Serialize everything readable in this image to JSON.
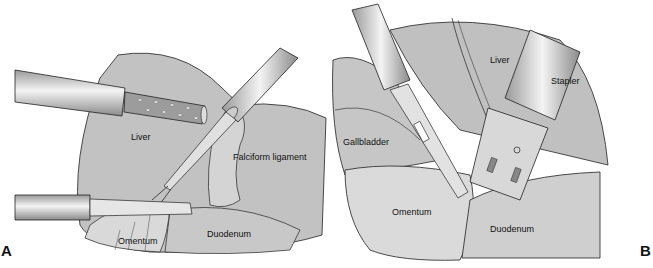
{
  "figure": {
    "panels": [
      {
        "id": "A",
        "letter": "A",
        "labels": {
          "liver": "Liver",
          "falciform": "Falciform ligament",
          "omentum": "Omentum",
          "duodenum": "Duodenum"
        }
      },
      {
        "id": "B",
        "letter": "B",
        "labels": {
          "liver": "Liver",
          "stapler": "Stapler",
          "gallbladder": "Gallbladder",
          "omentum": "Omentum",
          "duodenum": "Duodenum"
        }
      }
    ],
    "colors": {
      "tissue": "#bdbdbd",
      "tissue_light": "#d6d6d6",
      "instrument": "#c8c8c8",
      "instrument_highlight": "#f2f2f2",
      "line": "#222222"
    }
  }
}
